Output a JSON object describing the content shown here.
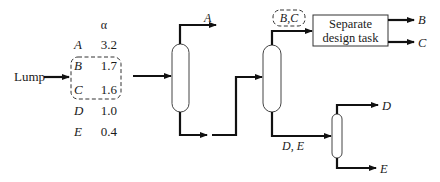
{
  "diagram": {
    "feed_label": "Lump",
    "alpha_header": "α",
    "components": [
      {
        "name": "A",
        "alpha": "3.2"
      },
      {
        "name": "B",
        "alpha": "1.7"
      },
      {
        "name": "C",
        "alpha": "1.6"
      },
      {
        "name": "D",
        "alpha": "1.0"
      },
      {
        "name": "E",
        "alpha": "0.4"
      }
    ],
    "lumped_group": "B, C",
    "column1": {
      "top_product": "A"
    },
    "column2": {
      "top_product_label": "B,C",
      "bottom_product_label": "D, E"
    },
    "task_box": {
      "line1": "Separate",
      "line2": "design task"
    },
    "task_outputs": [
      "B",
      "C"
    ],
    "column3": {
      "top_product": "D",
      "bottom_product": "E"
    }
  }
}
